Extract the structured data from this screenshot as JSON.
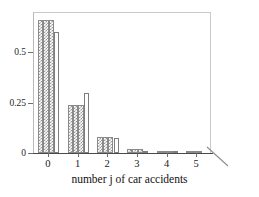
{
  "chart_data": {
    "type": "bar",
    "title": "",
    "subtitle": "",
    "xlabel": "number j of car accidents",
    "ylabel": "",
    "categories": [
      "0",
      "1",
      "2",
      "3",
      "4",
      "5"
    ],
    "xtick_labels": [
      "0",
      "1",
      "2",
      "3",
      "4",
      "5"
    ],
    "ytick_labels": [
      "0",
      "0.25",
      "0.5"
    ],
    "ytick_values": [
      0,
      0.25,
      0.5
    ],
    "ylim": [
      0,
      0.7
    ],
    "xlim": [
      -0.5,
      5.5
    ],
    "grid": false,
    "legend": false,
    "legend_position": "none",
    "bar_fills": [
      "hatched",
      "hatched",
      "hatched",
      "plain"
    ],
    "series": [
      {
        "name": "sample 1",
        "fill": "hatched",
        "values": [
          0.66,
          0.236,
          0.08,
          0.019,
          0.004,
          0.001
        ]
      },
      {
        "name": "sample 2",
        "fill": "hatched",
        "values": [
          0.66,
          0.236,
          0.08,
          0.019,
          0.004,
          0.001
        ]
      },
      {
        "name": "sample 3",
        "fill": "hatched",
        "values": [
          0.66,
          0.236,
          0.08,
          0.019,
          0.004,
          0.001
        ]
      },
      {
        "name": "model",
        "fill": "plain",
        "values": [
          0.6,
          0.3,
          0.075,
          0.012,
          0.002,
          0.0
        ]
      }
    ]
  }
}
